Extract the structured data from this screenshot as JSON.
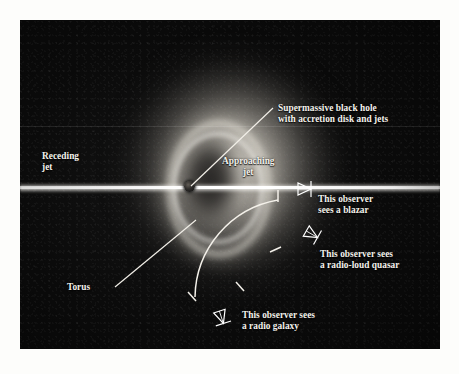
{
  "figure": {
    "kind": "agn-unified-model-diagram",
    "background_color": "#fdfdfb",
    "plate_color": "#0a0a0a",
    "label_color": "#f4f2ec",
    "jet_color": "#ffffff",
    "glow_color": "#d7d2c8"
  },
  "labels": {
    "black_hole": "Supermassive black hole\nwith accretion disk and jets",
    "receding_jet": "Receding\njet",
    "approaching_jet": "Approaching\njet",
    "torus": "Torus",
    "observer_blazar": "This observer\nsees a blazar",
    "observer_quasar": "This observer sees\na radio-loud quasar",
    "observer_radio_galaxy": "This observer sees\na radio galaxy"
  },
  "observers": [
    {
      "id": "blazar",
      "label": "This observer\nsees a blazar",
      "icon": "observer-eye-icon",
      "angle_deg": 0
    },
    {
      "id": "quasar",
      "label": "This observer sees\na radio-loud quasar",
      "icon": "observer-eye-icon",
      "angle_deg": 35
    },
    {
      "id": "radio-galaxy",
      "label": "This observer sees\na radio galaxy",
      "icon": "observer-eye-icon",
      "angle_deg": 78
    }
  ],
  "components": [
    {
      "id": "black-hole",
      "name": "supermassive-black-hole"
    },
    {
      "id": "accretion-disk",
      "name": "accretion-disk"
    },
    {
      "id": "torus",
      "name": "dusty-torus"
    },
    {
      "id": "jet-approach",
      "name": "approaching-jet"
    },
    {
      "id": "jet-recede",
      "name": "receding-jet"
    },
    {
      "id": "viewing-arc",
      "name": "viewing-angle-arc"
    }
  ]
}
